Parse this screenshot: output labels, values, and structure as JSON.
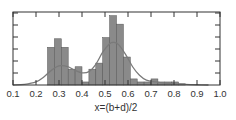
{
  "chart_data": {
    "type": "bar",
    "subtype": "histogram_with_density_curve",
    "title": "",
    "xlabel": "x=(b+d)/2",
    "ylabel": "",
    "xlim": [
      0.1,
      1.0
    ],
    "ylim": [
      0,
      6
    ],
    "x_ticks": [
      "0.1",
      "0.2",
      "0.3",
      "0.4",
      "0.5",
      "0.6",
      "0.7",
      "0.8",
      "0.9",
      "1.0"
    ],
    "y_ticks_count": 6,
    "y_tick_labels_shown": false,
    "grid": false,
    "legend": null,
    "bin_width": 0.03,
    "bins": [
      {
        "x0": 0.25,
        "x1": 0.28,
        "value": 3.1
      },
      {
        "x0": 0.28,
        "x1": 0.31,
        "value": 3.8
      },
      {
        "x0": 0.31,
        "x1": 0.34,
        "value": 3.1
      },
      {
        "x0": 0.34,
        "x1": 0.37,
        "value": 1.3
      },
      {
        "x0": 0.37,
        "x1": 0.4,
        "value": 1.5
      },
      {
        "x0": 0.4,
        "x1": 0.43,
        "value": 0.25
      },
      {
        "x0": 0.43,
        "x1": 0.46,
        "value": 1.3
      },
      {
        "x0": 0.46,
        "x1": 0.49,
        "value": 1.8
      },
      {
        "x0": 0.49,
        "x1": 0.52,
        "value": 3.9
      },
      {
        "x0": 0.52,
        "x1": 0.55,
        "value": 5.7
      },
      {
        "x0": 0.55,
        "x1": 0.58,
        "value": 5.0
      },
      {
        "x0": 0.58,
        "x1": 0.61,
        "value": 2.3
      },
      {
        "x0": 0.61,
        "x1": 0.64,
        "value": 0.5
      },
      {
        "x0": 0.64,
        "x1": 0.67,
        "value": 0.25
      },
      {
        "x0": 0.67,
        "x1": 0.7,
        "value": 0.25
      },
      {
        "x0": 0.7,
        "x1": 0.73,
        "value": 0.5
      },
      {
        "x0": 0.73,
        "x1": 0.76,
        "value": 0.25
      },
      {
        "x0": 0.76,
        "x1": 0.79,
        "value": 0.25
      },
      {
        "x0": 0.79,
        "x1": 0.82,
        "value": 0.25
      },
      {
        "x0": 0.82,
        "x1": 0.85,
        "value": 0.1
      }
    ],
    "curve": {
      "name": "density fit",
      "x": [
        0.1,
        0.15,
        0.2,
        0.23,
        0.26,
        0.29,
        0.31,
        0.34,
        0.37,
        0.4,
        0.43,
        0.46,
        0.49,
        0.52,
        0.54,
        0.56,
        0.59,
        0.62,
        0.65,
        0.68,
        0.72,
        0.76,
        0.8,
        0.85,
        0.9,
        0.95
      ],
      "y": [
        0.0,
        0.05,
        0.25,
        0.6,
        1.1,
        1.5,
        1.6,
        1.5,
        1.2,
        1.0,
        1.1,
        1.7,
        2.7,
        3.4,
        3.5,
        3.3,
        2.5,
        1.5,
        0.8,
        0.4,
        0.25,
        0.15,
        0.1,
        0.05,
        0.02,
        0.0
      ]
    },
    "colors": {
      "bar_fill": "#8a8a8a",
      "bar_stroke": "#555555",
      "curve": "#7a7a7a",
      "axis": "#333333"
    }
  }
}
